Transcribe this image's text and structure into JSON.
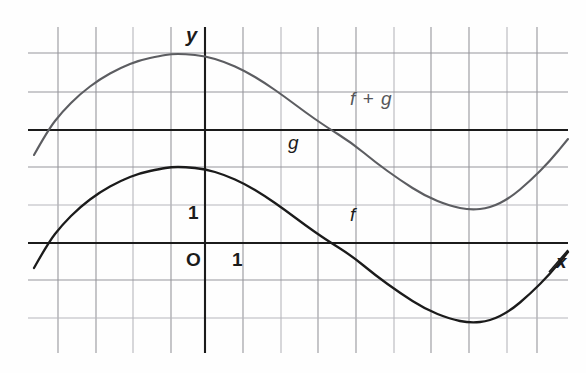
{
  "figure": {
    "width": 586,
    "height": 373,
    "background": "#fefefe"
  },
  "labels": {
    "y_axis": "y",
    "x_axis": "x",
    "origin": "O",
    "unit_x": "1",
    "unit_y": "1",
    "curve_g": "g",
    "curve_f": "f",
    "curve_f_plus_g": "f + g"
  },
  "colors": {
    "grid": "#8d8d93",
    "grid_faint": "#b9b9bf",
    "axis": "#1b1b1b",
    "curve_f": "#1b1b1b",
    "curve_fg": "#5c5d61",
    "text": "#1b1b1b"
  },
  "chart_data": {
    "type": "line",
    "title": "",
    "xlabel": "x",
    "ylabel": "y",
    "grid": true,
    "legend": "inline-annotations",
    "axes": {
      "origin_px": {
        "x": 205,
        "y": 243
      },
      "unit_px": 37.7,
      "xlim": [
        -4.7,
        9.6
      ],
      "ylim": [
        -2.9,
        5.0
      ],
      "x_axis_pixel_y": 243,
      "y_axis_pixel_x": 205,
      "grid_vertical_px": [
        58,
        96,
        133,
        171,
        205,
        243,
        281,
        318,
        356,
        394,
        431,
        469,
        507,
        537
      ],
      "grid_horizontal_px": [
        53,
        92,
        130,
        167,
        205,
        243,
        280,
        318
      ],
      "grid_left_px": 28,
      "grid_right_px": 568,
      "grid_top_px": 27,
      "grid_bottom_px": 353
    },
    "series": [
      {
        "name": "f",
        "label": "f",
        "style": "solid-dark",
        "description": "Sinusoidal curve: rises from lower left, peaks near x=-1, decreases through a zero near x=3.9, bottoms near x=7",
        "points_px": [
          [
            34,
            268
          ],
          [
            48,
            243
          ],
          [
            62,
            225
          ],
          [
            80,
            207
          ],
          [
            100,
            192
          ],
          [
            120,
            181
          ],
          [
            140,
            173
          ],
          [
            160,
            169
          ],
          [
            171,
            167
          ],
          [
            185,
            167
          ],
          [
            205,
            169
          ],
          [
            225,
            175
          ],
          [
            245,
            184
          ],
          [
            265,
            196
          ],
          [
            285,
            210
          ],
          [
            305,
            225
          ],
          [
            325,
            239
          ],
          [
            352,
            256
          ],
          [
            375,
            275
          ],
          [
            400,
            293
          ],
          [
            425,
            309
          ],
          [
            450,
            319
          ],
          [
            470,
            323
          ],
          [
            490,
            321
          ],
          [
            510,
            311
          ],
          [
            530,
            294
          ],
          [
            550,
            274
          ],
          [
            568,
            252
          ]
        ],
        "points_data": [
          [
            -4.54,
            -0.66
          ],
          [
            -4.17,
            0.0
          ],
          [
            -3.79,
            0.48
          ],
          [
            -3.32,
            0.95
          ],
          [
            -2.79,
            1.35
          ],
          [
            -2.25,
            1.64
          ],
          [
            -1.72,
            1.86
          ],
          [
            -1.19,
            1.96
          ],
          [
            -0.9,
            2.02
          ],
          [
            -0.53,
            2.02
          ],
          [
            0.0,
            1.96
          ],
          [
            0.53,
            1.8
          ],
          [
            1.06,
            1.56
          ],
          [
            1.59,
            1.25
          ],
          [
            2.12,
            0.88
          ],
          [
            2.65,
            0.48
          ],
          [
            3.18,
            0.11
          ],
          [
            3.9,
            -0.34
          ],
          [
            4.51,
            -0.85
          ],
          [
            5.17,
            -1.33
          ],
          [
            5.84,
            -1.75
          ],
          [
            6.5,
            -2.02
          ],
          [
            7.03,
            -2.12
          ],
          [
            7.56,
            -2.07
          ],
          [
            8.09,
            -1.8
          ],
          [
            8.62,
            -1.35
          ],
          [
            9.15,
            -0.82
          ],
          [
            9.63,
            -0.24
          ]
        ]
      },
      {
        "name": "g",
        "label": "g",
        "style": "horizontal-line",
        "description": "Constant function, a horizontal line 3 units above the x-axis",
        "value": 3,
        "pixel_y": 130,
        "points_px": [
          [
            28,
            130
          ],
          [
            568,
            130
          ]
        ],
        "points_data": [
          [
            -4.7,
            3.0
          ],
          [
            9.63,
            3.0
          ]
        ]
      },
      {
        "name": "f + g",
        "label": "f + g",
        "style": "solid-gray",
        "description": "Sum curve: same shape as f translated upward by 3 units",
        "points_px": [
          [
            34,
            155
          ],
          [
            48,
            130
          ],
          [
            62,
            112
          ],
          [
            80,
            94
          ],
          [
            100,
            79
          ],
          [
            120,
            68
          ],
          [
            140,
            60
          ],
          [
            160,
            56
          ],
          [
            171,
            54
          ],
          [
            185,
            54
          ],
          [
            205,
            56
          ],
          [
            225,
            62
          ],
          [
            245,
            71
          ],
          [
            265,
            83
          ],
          [
            285,
            97
          ],
          [
            305,
            112
          ],
          [
            325,
            126
          ],
          [
            352,
            143
          ],
          [
            375,
            162
          ],
          [
            400,
            180
          ],
          [
            425,
            196
          ],
          [
            450,
            206
          ],
          [
            470,
            210
          ],
          [
            490,
            208
          ],
          [
            510,
            198
          ],
          [
            530,
            181
          ],
          [
            550,
            161
          ],
          [
            568,
            139
          ]
        ],
        "points_data": [
          [
            -4.54,
            2.34
          ],
          [
            -4.17,
            3.0
          ],
          [
            -3.79,
            3.48
          ],
          [
            -3.32,
            3.95
          ],
          [
            -2.79,
            4.35
          ],
          [
            -2.25,
            4.64
          ],
          [
            -1.72,
            4.86
          ],
          [
            -1.19,
            4.96
          ],
          [
            -0.9,
            5.02
          ],
          [
            -0.53,
            5.02
          ],
          [
            0.0,
            4.96
          ],
          [
            0.53,
            4.8
          ],
          [
            1.06,
            4.56
          ],
          [
            1.59,
            4.25
          ],
          [
            2.12,
            3.88
          ],
          [
            2.65,
            3.48
          ],
          [
            3.18,
            3.11
          ],
          [
            3.9,
            2.66
          ],
          [
            4.51,
            2.15
          ],
          [
            5.17,
            1.67
          ],
          [
            5.84,
            1.25
          ],
          [
            6.5,
            0.98
          ],
          [
            7.03,
            0.88
          ],
          [
            7.56,
            0.93
          ],
          [
            8.09,
            1.2
          ],
          [
            8.62,
            1.65
          ],
          [
            9.15,
            2.18
          ],
          [
            9.63,
            2.76
          ]
        ]
      }
    ]
  }
}
